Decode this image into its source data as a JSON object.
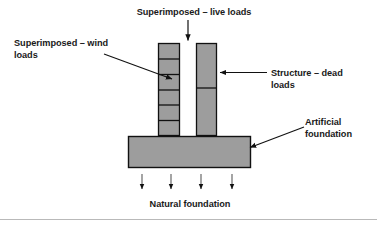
{
  "diagram": {
    "labels": {
      "live_loads": "Superimposed – live loads",
      "wind_loads": "Superimposed – wind\nloads",
      "dead_loads": "Structure – dead\nloads",
      "artificial_foundation": "Artificial\nfoundation",
      "natural_foundation": "Natural foundation"
    },
    "colors": {
      "fill": "#9d9d9d",
      "stroke": "#111111",
      "text": "#1a1a1a",
      "background": "#ffffff",
      "rule": "#b9b9b9"
    },
    "shapes": {
      "left_column": {
        "name": "segmented-column",
        "x": 158,
        "y": 43,
        "width": 22,
        "height": 93,
        "segments": 6
      },
      "right_column": {
        "name": "solid-column",
        "x": 196,
        "y": 43,
        "width": 21,
        "height": 93,
        "segments": 2,
        "divider_fraction": 0.36
      },
      "foundation_slab": {
        "name": "artificial-foundation-slab",
        "x": 128,
        "y": 136,
        "width": 123,
        "height": 32
      }
    },
    "arrows": {
      "live_load": {
        "from": [
          188,
          20
        ],
        "to": [
          188,
          41
        ],
        "direction": "down"
      },
      "wind_load": {
        "from": [
          104,
          54
        ],
        "to": [
          173,
          79
        ],
        "direction": "down-right"
      },
      "dead_load": {
        "from": [
          266,
          72
        ],
        "to": [
          220,
          72
        ],
        "direction": "left"
      },
      "artificial_foundation": {
        "from": [
          303,
          128
        ],
        "to": [
          249,
          148
        ],
        "direction": "down-left"
      },
      "reactions": [
        {
          "x": 142,
          "y1": 174,
          "y2": 190
        },
        {
          "x": 171,
          "y1": 174,
          "y2": 190
        },
        {
          "x": 201,
          "y1": 174,
          "y2": 190
        },
        {
          "x": 232,
          "y1": 174,
          "y2": 190
        }
      ]
    }
  }
}
